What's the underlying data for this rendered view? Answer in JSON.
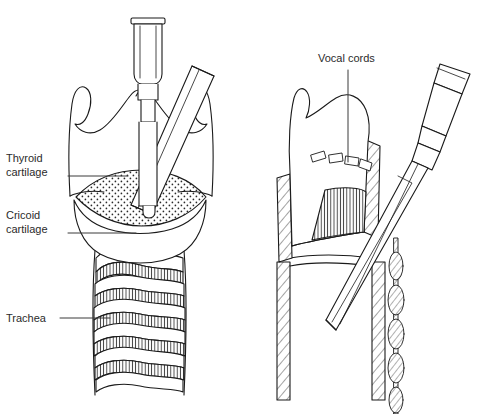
{
  "figure": {
    "type": "medical-illustration",
    "background_color": "#ffffff",
    "line_color": "#1a1a1a",
    "label_color": "#2b2b2b",
    "panels": [
      {
        "id": "left",
        "view": "anterior",
        "name": "anterior-larynx-view"
      },
      {
        "id": "right",
        "view": "sagittal-cutaway",
        "name": "sagittal-larynx-view"
      }
    ]
  },
  "labels": {
    "thyroid_cartilage": {
      "line1": "Thyroid",
      "line2": "cartilage"
    },
    "cricoid_cartilage": {
      "line1": "Cricoid",
      "line2": "cartilage"
    },
    "trachea": {
      "line1": "Trachea"
    },
    "vocal_cords": {
      "line1": "Vocal cords"
    }
  },
  "left_panel": {
    "structures": [
      "thyroid-cartilage",
      "cricothyroid-membrane",
      "cricoid-cartilage",
      "trachea-rings"
    ],
    "instruments": [
      "needle-syringe-vertical",
      "angled-cannula-tube"
    ],
    "trachea_ring_count": 6,
    "membrane_fill": "stippled"
  },
  "right_panel": {
    "structures": [
      "thyroid-cartilage",
      "vocal-cords",
      "cricothyroid-membrane",
      "cut-tracheal-wall-left",
      "cut-tracheal-wall-right"
    ],
    "instruments": [
      "needle-hub-flared",
      "tapered-dilator",
      "coiled-guidewire"
    ],
    "vocal_cord_segment_count": 4,
    "membrane_fill": "vertical-hatch",
    "cut_edge_fill": "diagonal-hatch"
  }
}
